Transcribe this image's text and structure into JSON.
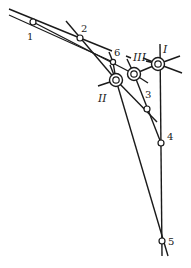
{
  "diagram": {
    "line_color": "#1a1a1a",
    "background": "#ffffff",
    "points": [
      {
        "id": "1",
        "label": "1",
        "x": 33,
        "y": 22,
        "lx": 27,
        "ly": 40
      },
      {
        "id": "2",
        "label": "2",
        "x": 80,
        "y": 38,
        "lx": 81,
        "ly": 32
      },
      {
        "id": "6",
        "label": "6",
        "x": 113,
        "y": 62,
        "lx": 114,
        "ly": 56
      },
      {
        "id": "3",
        "label": "3",
        "x": 147,
        "y": 109,
        "lx": 145,
        "ly": 98
      },
      {
        "id": "4",
        "label": "4",
        "x": 161,
        "y": 143,
        "lx": 167,
        "ly": 140
      },
      {
        "id": "5",
        "label": "5",
        "x": 162,
        "y": 241,
        "lx": 168,
        "ly": 245
      }
    ],
    "joints": [
      {
        "id": "I",
        "label": "I",
        "x": 158,
        "y": 64,
        "lx": 163,
        "ly": 53
      },
      {
        "id": "II",
        "label": "II",
        "x": 116,
        "y": 80,
        "lx": 98,
        "ly": 102
      },
      {
        "id": "III",
        "label": "III",
        "x": 134,
        "y": 74,
        "lx": 134,
        "ly": 61
      }
    ]
  }
}
